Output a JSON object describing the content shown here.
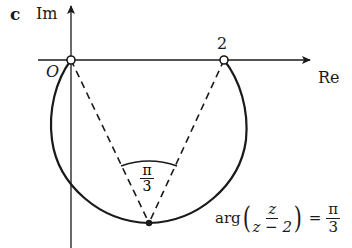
{
  "figure": {
    "panel_label": "c",
    "axes": {
      "imaginary_label": "Im",
      "real_label": "Re",
      "origin_label": "O"
    },
    "points": {
      "origin_marker": "open-circle",
      "point_two_label": "2",
      "point_two_marker": "open-circle",
      "bottom_point_marker": "filled-dot"
    },
    "angle_label": {
      "numerator": "π",
      "denominator": "3"
    },
    "equation": {
      "function": "arg",
      "fraction_numerator": "z",
      "fraction_denominator": "z − 2",
      "equals": "=",
      "rhs_numerator": "π",
      "rhs_denominator": "3"
    },
    "colors": {
      "stroke": "#1a1a1a",
      "background": "#ffffff"
    }
  }
}
